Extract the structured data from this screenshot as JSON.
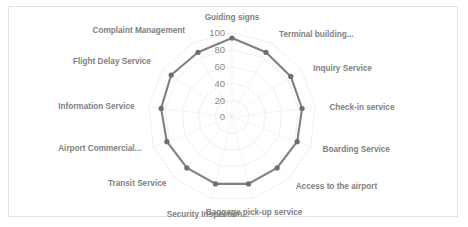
{
  "chart_data": {
    "type": "radar",
    "title": "",
    "categories": [
      "Guiding signs",
      "Terminal building...",
      "Inquiry Service",
      "Check-in service",
      "Boarding Service",
      "Access to the airport",
      "Baggage pick-up service",
      "Security Inspection...",
      "Transit Service",
      "Airport Commercial...",
      "Information Service",
      "Flight Delay Service",
      "Complaint Management"
    ],
    "values": [
      94,
      87,
      85,
      84,
      83,
      81,
      82,
      82,
      81,
      83,
      85,
      88,
      87
    ],
    "tick_labels": [
      "0",
      "20",
      "40",
      "60",
      "80",
      "100"
    ],
    "tick_values": [
      0,
      20,
      40,
      60,
      80,
      100
    ],
    "rlim": [
      0,
      100
    ],
    "grid": true,
    "legend": false,
    "xlabel": "",
    "ylabel": "",
    "series": [
      {
        "name": "Satisfaction",
        "values": [
          94,
          87,
          85,
          84,
          83,
          81,
          82,
          82,
          81,
          83,
          85,
          88,
          87
        ]
      }
    ],
    "colors": {
      "series": "#808080",
      "marker": "#6f6f6f",
      "grid": "#e8e8e8",
      "text": "#808080",
      "frame": "#e3e3e3",
      "background": "#ffffff"
    }
  }
}
